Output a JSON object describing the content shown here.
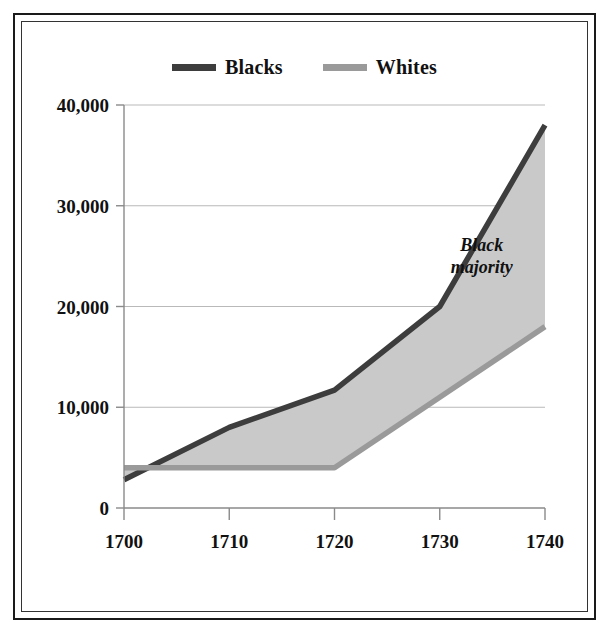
{
  "chart_data": {
    "type": "line",
    "title": "",
    "subtitle": "",
    "xlabel": "",
    "ylabel": "",
    "x": [
      1700,
      1710,
      1720,
      1730,
      1740
    ],
    "xtick_labels": [
      "1700",
      "1710",
      "1720",
      "1730",
      "1740"
    ],
    "ytick_labels": [
      "0",
      "10,000",
      "20,000",
      "30,000",
      "40,000"
    ],
    "ytick_values": [
      0,
      10000,
      20000,
      30000,
      40000
    ],
    "xlim": [
      1700,
      1740
    ],
    "ylim": [
      0,
      40000
    ],
    "grid": "horizontal",
    "legend_position": "top-center",
    "series": [
      {
        "name": "Blacks",
        "color": "#3d3d3d",
        "values": [
          2800,
          8000,
          11700,
          20000,
          38000
        ]
      },
      {
        "name": "Whites",
        "color": "#9a9a9a",
        "values": [
          4000,
          4000,
          4000,
          11000,
          18000
        ]
      }
    ],
    "fill_between": {
      "label": "area-between-series",
      "color": "#c9c9c9"
    },
    "annotations": [
      {
        "text_line1": "Black",
        "text_line2": "majority",
        "x": 1734,
        "y": 25500
      }
    ]
  },
  "legend": {
    "items": [
      {
        "label": "Blacks",
        "color": "#3d3d3d"
      },
      {
        "label": "Whites",
        "color": "#9a9a9a"
      }
    ]
  },
  "frame": {
    "border_color": "#1a1a1a",
    "background": "#ffffff"
  }
}
